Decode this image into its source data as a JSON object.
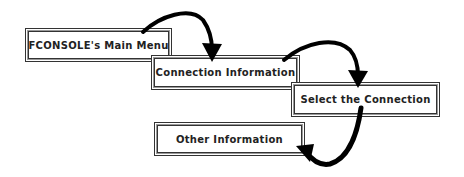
{
  "diagram": {
    "nodes": [
      {
        "id": "main-menu",
        "label": "FCONSOLE's Main Menu"
      },
      {
        "id": "connection-information",
        "label": "Connection Information"
      },
      {
        "id": "select-connection",
        "label": "Select the Connection"
      },
      {
        "id": "other-information",
        "label": "Other Information"
      }
    ],
    "edges": [
      {
        "from": "main-menu",
        "to": "connection-information"
      },
      {
        "from": "connection-information",
        "to": "select-connection"
      },
      {
        "from": "select-connection",
        "to": "other-information"
      }
    ],
    "colors": {
      "arrow": "#000000",
      "box_border": "#333333",
      "text": "#222222",
      "background": "#ffffff"
    }
  }
}
